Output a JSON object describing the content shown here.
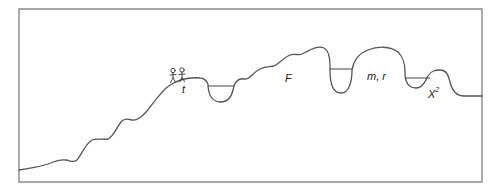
{
  "diagram": {
    "type": "fitness-landscape",
    "labels": {
      "t": "t",
      "F": "F",
      "mr": "m, r",
      "chi_base": "X",
      "chi_exp": "2"
    },
    "figures": {
      "count": 2,
      "description": "two stick figures walking on the curve"
    },
    "pits": [
      {
        "name": "pit-1",
        "water_level": true
      },
      {
        "name": "pit-2",
        "water_level": true
      },
      {
        "name": "pit-3",
        "water_level": true
      }
    ],
    "colors": {
      "frame": "#8a8a8a",
      "curve": "#555555",
      "text": "#222222",
      "background": "#ffffff"
    }
  }
}
